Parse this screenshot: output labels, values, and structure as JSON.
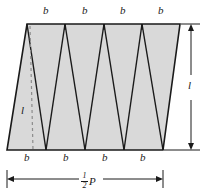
{
  "figure": {
    "kind": "geometry-diagram",
    "colors": {
      "fill": "#d9d9d9",
      "stroke": "#1a1a1a",
      "dashed": "#8c8c8c",
      "dimension": "#1a1a1a",
      "background": "#ffffff"
    },
    "shape": {
      "top_left_x": 27,
      "top_right_x": 180,
      "top_y": 24,
      "bottom_left_x": 7,
      "bottom_right_x": 163,
      "bottom_y": 150,
      "top_vertices_x": [
        27,
        65,
        104,
        142,
        180
      ],
      "bottom_vertices_x": [
        7,
        46,
        85,
        124,
        163
      ]
    },
    "labels": {
      "base": "b",
      "height": "l",
      "half_perimeter_numerator": "1",
      "half_perimeter_denominator": "2",
      "half_perimeter_symbol": "P"
    },
    "top_base_labels": [
      "b",
      "b",
      "b",
      "b"
    ],
    "bottom_base_labels": [
      "b",
      "b",
      "b",
      "b"
    ],
    "height_labels": {
      "interior": "l",
      "right_dimension": "l"
    },
    "width_dimension": {
      "label": "1/2 P",
      "from_x": 7,
      "to_x": 163,
      "y": 179
    },
    "height_dimension": {
      "label": "l",
      "x": 191,
      "from_y": 24,
      "to_y": 150
    }
  }
}
